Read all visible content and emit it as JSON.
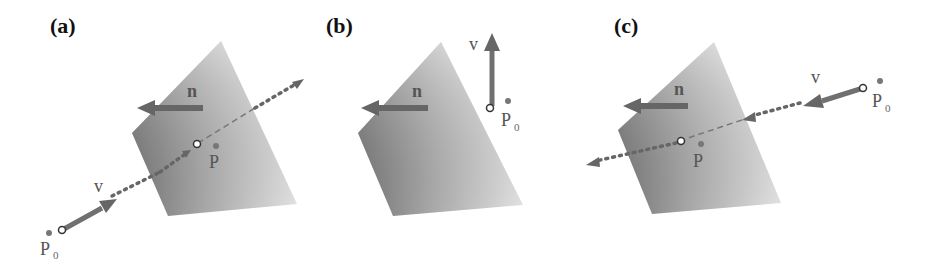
{
  "figure": {
    "panels": [
      {
        "id": "a",
        "label": "(a)",
        "normal_label": "n",
        "direction_label": "v",
        "origin_label": "P",
        "origin_subscript": "0",
        "intersection_label": "P",
        "description": "ray from P0 along v intersects plane at P"
      },
      {
        "id": "b",
        "label": "(b)",
        "normal_label": "n",
        "direction_label": "v",
        "origin_label": "P",
        "origin_subscript": "0",
        "description": "ray parallel to plane, no intersection"
      },
      {
        "id": "c",
        "label": "(c)",
        "normal_label": "n",
        "direction_label": "v",
        "origin_label": "P",
        "origin_subscript": "0",
        "intersection_label": "P",
        "description": "ray from P0 along v (against n) intersects plane at P"
      }
    ],
    "colors": {
      "plane_dark": "#7a7a7a",
      "plane_light": "#f4f4f4",
      "arrow": "#666666",
      "dotted_ray": "#666666",
      "point": "#777777",
      "text": "#555555",
      "panel_label": "#111111"
    }
  }
}
